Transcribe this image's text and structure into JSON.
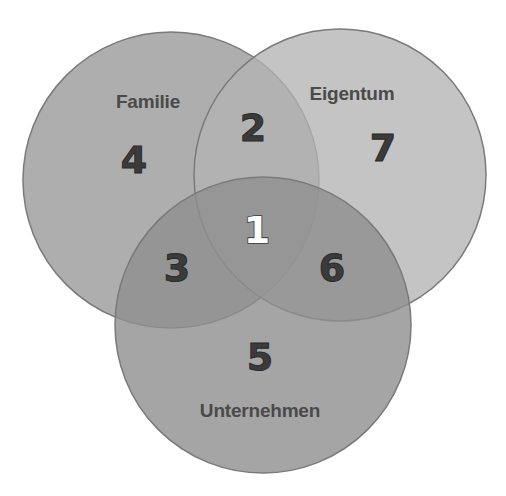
{
  "diagram": {
    "type": "venn-3",
    "sets": [
      {
        "id": "familie",
        "label": "Familie",
        "fill": "#9c9c9c",
        "opacity": 0.82
      },
      {
        "id": "eigentum",
        "label": "Eigentum",
        "fill": "#b4b4b4",
        "opacity": 0.78
      },
      {
        "id": "unternehmen",
        "label": "Unternehmen",
        "fill": "#8f8f8f",
        "opacity": 0.8
      }
    ],
    "regions": [
      {
        "number": "1",
        "sets": [
          "familie",
          "eigentum",
          "unternehmen"
        ]
      },
      {
        "number": "2",
        "sets": [
          "familie",
          "eigentum"
        ]
      },
      {
        "number": "3",
        "sets": [
          "familie",
          "unternehmen"
        ]
      },
      {
        "number": "4",
        "sets": [
          "familie"
        ]
      },
      {
        "number": "5",
        "sets": [
          "unternehmen"
        ]
      },
      {
        "number": "6",
        "sets": [
          "eigentum",
          "unternehmen"
        ]
      },
      {
        "number": "7",
        "sets": [
          "eigentum"
        ]
      }
    ],
    "colors": {
      "stroke": "#7a7a7a",
      "number_text": "#3b3b3b",
      "center_number_text": "#ffffff",
      "label_text": "#4a4a4a"
    }
  }
}
